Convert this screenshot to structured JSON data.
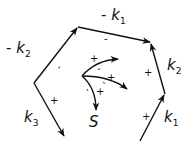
{
  "diagram": {
    "type": "vector-path-diagram",
    "stroke_color": "#111111",
    "background": "#ffffff",
    "labels": {
      "left_upper": {
        "prefix": "- ",
        "main": "k",
        "sub": "2"
      },
      "left_lower": {
        "prefix": "",
        "main": "k",
        "sub": "3"
      },
      "top": {
        "prefix": "- ",
        "main": "k",
        "sub": "1"
      },
      "right_upper": {
        "prefix": "",
        "main": "k",
        "sub": "2"
      },
      "right_lower": {
        "prefix": "",
        "main": "k",
        "sub": "1"
      },
      "center": "S"
    },
    "signs": {
      "left_upper_edge": "-",
      "left_lower_edge": "+",
      "top_edge": "-",
      "right_upper_edge": "+",
      "right_lower_edge": "+",
      "center_up_plus": "+",
      "center_up_minus": "-",
      "center_right_plus": "+",
      "center_right_minus": "-",
      "center_down_plus": "+",
      "center_down_minus": "-"
    },
    "center_arrows": [
      "up-right",
      "right",
      "down"
    ]
  }
}
